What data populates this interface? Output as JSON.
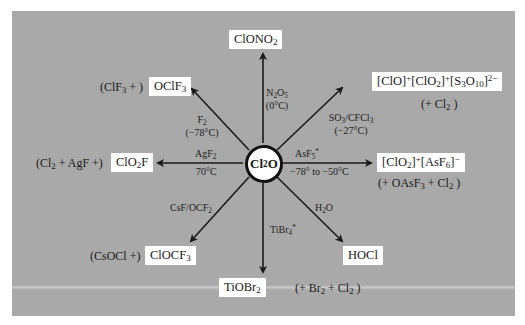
{
  "diagram": {
    "center": {
      "label": "Cl2O",
      "display": [
        "Cl",
        "2",
        "O"
      ]
    },
    "background_color": "#a9a9a9",
    "box_color": "#ffffff",
    "arrow_color": "#1a1a1a",
    "branches": [
      {
        "direction": "up",
        "product": "ClONO2",
        "product_parts": [
          "ClONO",
          "2"
        ],
        "reagent": [
          "N2O5",
          "(0°C)"
        ],
        "reagent_parts": {
          "line1": [
            "N",
            "2",
            "O",
            "5"
          ],
          "line2": "(0°C)"
        }
      },
      {
        "direction": "up-right",
        "product": "[ClO]+[ClO2]+[S3O10]2-",
        "byproduct": "(+ Cl2)",
        "reagent": [
          "SO3/CFCl3",
          "(−27°C)"
        ]
      },
      {
        "direction": "right",
        "product": "[ClO2]+[AsF6]-",
        "byproduct": "(+ OAsF3 + Cl2)",
        "reagent": [
          "AsF5*",
          "−78° to −50°C"
        ]
      },
      {
        "direction": "down-right",
        "product": "HOCl",
        "reagent": [
          "H2O"
        ]
      },
      {
        "direction": "down",
        "product": "TiOBr2",
        "byproduct": "(+ Br2 + Cl2)",
        "reagent": [
          "TiBr4*"
        ]
      },
      {
        "direction": "down-left",
        "product": "ClOCF3",
        "byproduct": "(CsOCl +)",
        "reagent": [
          "CsF/OCF2"
        ]
      },
      {
        "direction": "left",
        "product": "ClO2F",
        "byproduct": "(Cl2 + AgF +)",
        "reagent": [
          "AgF2",
          "70°C"
        ]
      },
      {
        "direction": "up-left",
        "product": "OClF3",
        "byproduct": "(ClF3 + )",
        "reagent": [
          "F2",
          "(−78°C)"
        ]
      }
    ],
    "text": {
      "up_reagent_temp": "(0°C)",
      "upright_reagent_temp": "(−27°C)",
      "right_reagent_temp": "−78° to −50°C",
      "left_reagent_temp": "70°C",
      "upleft_reagent_temp": "(−78°C)",
      "upleft_byproduct_open": "(ClF",
      "upleft_byproduct_close": " + )",
      "left_byproduct_open": "(Cl",
      "left_byproduct_close": " + AgF +)",
      "downleft_byproduct": "(CsOCl +)",
      "down_byproduct_open": "(+ Br",
      "down_byproduct_mid": " + Cl",
      "down_byproduct_close": " )",
      "right_byproduct_open": "(+ OAsF",
      "right_byproduct_mid": " + Cl",
      "right_byproduct_close": " )",
      "upright_byproduct_open": "(+ Cl",
      "upright_byproduct_close": " )",
      "hocl": "HOCl",
      "tiobr": "TiOBr",
      "clocf": "ClOCF",
      "oclf": "OClF",
      "clono": "ClONO",
      "clo2f_a": "ClO",
      "clo2f_b": "F",
      "sub2": "2",
      "sub3": "3",
      "sub4": "4",
      "sub5": "5",
      "sub6": "6",
      "sub10": "10",
      "plus": "+",
      "minus": "−",
      "two_minus": "2−",
      "star": "*",
      "cl": "Cl",
      "o": "O",
      "n": "N",
      "h": "H",
      "f": "F",
      "agf": "AgF",
      "asf": "AsF",
      "so": "SO",
      "cfcl": "/CFCl",
      "csf": "CsF/OCF",
      "tibr": "TiBr",
      "clo_br": "[ClO]",
      "clo2_br_open": "[ClO",
      "br_close": "]",
      "s_open": "[S",
      "o_mid": "O",
      "asf_open": "[AsF"
    }
  }
}
